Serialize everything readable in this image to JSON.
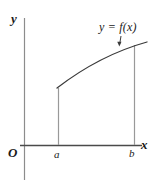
{
  "figure": {
    "kind": "math-function-graph",
    "background_color": "#ffffff",
    "ink_color": "#3a3a3a",
    "text_color": "#1a1a1a",
    "axes": {
      "y_axis_label": "y",
      "x_axis_label": "x",
      "origin_label": "O",
      "y_axis_x_px": 24,
      "y_axis_top_px": 18,
      "y_axis_bottom_px": 180,
      "x_axis_y_px": 145,
      "x_axis_left_px": 20,
      "x_axis_right_px": 142
    },
    "curve": {
      "label": "y = f(x)",
      "start": [
        57,
        88
      ],
      "end": [
        147,
        42
      ],
      "control": [
        100,
        55
      ],
      "description": "increasing concave-down curve"
    },
    "ordinates": [
      {
        "label": "a",
        "x_px": 58,
        "top_px": 88,
        "bottom_px": 145
      },
      {
        "label": "b",
        "x_px": 134,
        "top_px": 45,
        "bottom_px": 145
      }
    ],
    "leader": {
      "name": "label-pointer-arrow",
      "from": [
        121,
        36
      ],
      "to": [
        119,
        45
      ]
    }
  }
}
